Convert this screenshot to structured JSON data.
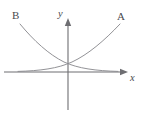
{
  "figure": {
    "background_color": "#ffffff",
    "width": 141,
    "height": 119,
    "axis_color": "#6e6e72",
    "curve_color": "#8c8c90",
    "label_color": "#4a4a4e"
  },
  "axes": {
    "x_axis": {
      "label": "x",
      "name": "x-axis",
      "origin_px": {
        "x": 68,
        "y": 72
      },
      "start_px": {
        "x": 4,
        "y": 72
      },
      "end_px": {
        "x": 128,
        "y": 72
      },
      "has_arrow": true,
      "arrow_end": "right"
    },
    "y_axis": {
      "label": "y",
      "name": "y-axis",
      "origin_px": {
        "x": 68,
        "y": 72
      },
      "start_px": {
        "x": 68,
        "y": 110
      },
      "end_px": {
        "x": 68,
        "y": 18
      },
      "has_arrow": true,
      "arrow_end": "top"
    }
  },
  "curves": [
    {
      "id": "A",
      "label": "A",
      "name": "curve-a",
      "description": "increasing exponential, asymptotic to x-axis on the left, rising steeply to the upper right",
      "label_position_px": {
        "x": 117,
        "y": 11
      },
      "path": "M 18 71.4 C 40 70.8, 58 68.5, 72 62 C 88 54.5, 104 41, 120 24"
    },
    {
      "id": "B",
      "label": "B",
      "name": "curve-b",
      "description": "decreasing exponential, falling steeply from the upper left, asymptotic to x-axis on the right",
      "label_position_px": {
        "x": 12,
        "y": 10
      },
      "path": "M 20 24 C 34 41, 49 54.5, 64 62 C 78 68.5, 96 70.8, 118 71.4"
    }
  ],
  "intersection": {
    "name": "curve-intersection",
    "approx_px": {
      "x": 68,
      "y": 64
    },
    "note": "curves cross just above the origin on the y-axis"
  },
  "arrows": {
    "x_arrow_points": "128,72 120,68.8 120,75.2",
    "y_arrow_points": "68,18 64.8,26 71.2,26"
  }
}
